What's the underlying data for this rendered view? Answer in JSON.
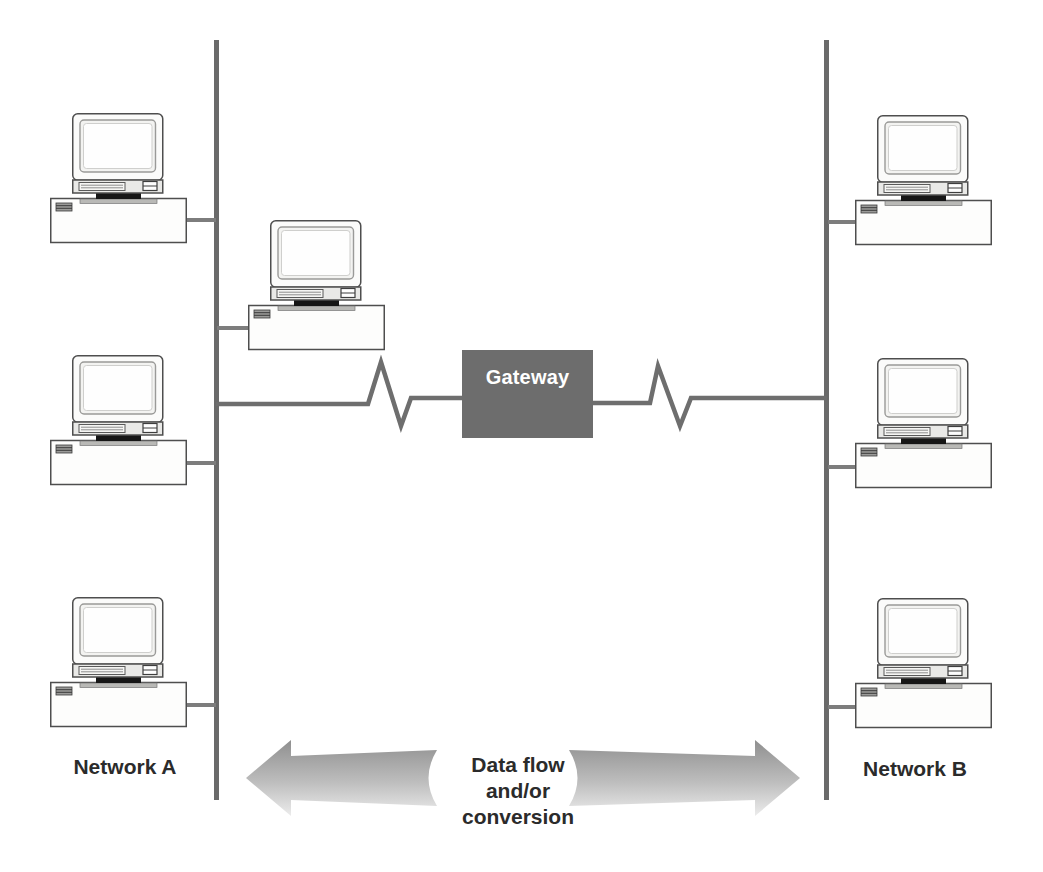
{
  "diagram": {
    "type": "network-gateway-diagram",
    "gateway": {
      "label": "Gateway"
    },
    "network_a": {
      "label": "Network A",
      "workstation_count": 3
    },
    "network_b": {
      "label": "Network B",
      "workstation_count": 3
    },
    "bridge_segment_workstation_count": 1,
    "flow_caption": {
      "lines": [
        "Data flow",
        "and/or",
        "conversion"
      ]
    },
    "colors": {
      "background": "#ffffff",
      "gateway_fill": "#6d6d6d",
      "gateway_text": "#ffffff",
      "bus_line": "#6a6a6a",
      "connector_line": "#7d7d7d",
      "zigzag_line": "#6e6e6e",
      "label_text": "#2b2b2b",
      "arrow_dark": "#8f8f8f",
      "arrow_light": "#ececec",
      "computer_outline": "#4e4e4e",
      "computer_fill": "#fdfdfc",
      "stand_fill": "#161616"
    }
  }
}
